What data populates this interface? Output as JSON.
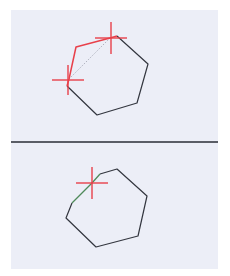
{
  "colors": {
    "background": "#ffffff",
    "panel": "#eceef7",
    "divider": "#5a5d66",
    "outline": "#33363f",
    "edit_edge": "#e8404a",
    "crosshair": "#e8404a",
    "preview_dashed": "#a9acb8",
    "result_edge": "#4f8a5a"
  },
  "top_panel": {
    "polygon_points": "117,36 148,64 137,103 97,115 67,86 69,79 76,47",
    "black_path": "117,36 148,64 137,103 97,115 67,86",
    "red_path": "67,86 69,79 76,47 110,38 117,36",
    "dashed_path": "69,79 110,38",
    "crosshairs": [
      {
        "cx": 111,
        "cy": 38,
        "half_w": 16,
        "half_h": 16
      },
      {
        "cx": 68,
        "cy": 80,
        "half_w": 16,
        "half_h": 15
      }
    ]
  },
  "bottom_panel": {
    "black_path": "100,174 117,169 147,196 138,236 96,247 66,218 72,203",
    "green_path": "72,203 92,183 100,174",
    "crosshairs": [
      {
        "cx": 92,
        "cy": 183,
        "half_w": 16,
        "half_h": 16
      }
    ]
  }
}
